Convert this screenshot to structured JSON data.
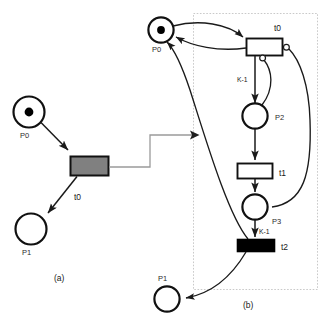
{
  "figure": {
    "type": "petri-net-diagram",
    "captions": [
      {
        "id": "caption-a",
        "text": "(a)"
      },
      {
        "id": "caption-b",
        "text": "(b)"
      }
    ],
    "colors": {
      "stroke": "#1a1a1a",
      "background": "#ffffff",
      "transition_filled_gray": "#808080",
      "transition_filled_black": "#000000",
      "transition_empty": "#ffffff",
      "dotted_group_border": "#c8c8c8",
      "connector_gray": "#8c8c8c",
      "label_text": "#2b2b2b"
    }
  },
  "panel_a": {
    "name": "(a)",
    "places": [
      {
        "id": "a-p0",
        "label": "P0",
        "tokens": 1
      },
      {
        "id": "a-p1",
        "label": "P1",
        "tokens": 0
      }
    ],
    "transitions": [
      {
        "id": "a-t0",
        "label": "t0",
        "fill": "gray"
      }
    ],
    "arcs": [
      {
        "from": "P0",
        "to": "t0",
        "kind": "normal",
        "weight": ""
      },
      {
        "from": "t0",
        "to": "P1",
        "kind": "normal",
        "weight": ""
      }
    ]
  },
  "connector": {
    "name": "refinement-arrow",
    "from": "panel_a.t0",
    "to": "panel_b",
    "style": "elbow-arrow"
  },
  "panel_b": {
    "name": "(b)",
    "group_box": {
      "style": "dotted"
    },
    "places": [
      {
        "id": "b-p0",
        "label": "P0",
        "tokens": 1
      },
      {
        "id": "b-p2",
        "label": "P2",
        "tokens": 0
      },
      {
        "id": "b-p3",
        "label": "P3",
        "tokens": 0
      },
      {
        "id": "b-p1",
        "label": "P1",
        "tokens": 0
      }
    ],
    "transitions": [
      {
        "id": "b-t0",
        "label": "t0",
        "fill": "white"
      },
      {
        "id": "b-t1",
        "label": "t1",
        "fill": "white"
      },
      {
        "id": "b-t2",
        "label": "t2",
        "fill": "black"
      }
    ],
    "arcs": [
      {
        "from": "P0",
        "to": "t0",
        "kind": "normal",
        "weight": ""
      },
      {
        "from": "t0",
        "to": "P0",
        "kind": "normal",
        "weight": ""
      },
      {
        "from": "t0",
        "to": "P2",
        "kind": "normal",
        "weight": "K-1"
      },
      {
        "from": "P2",
        "to": "t0",
        "kind": "inhibitor",
        "weight": ""
      },
      {
        "from": "P3",
        "to": "t0",
        "kind": "inhibitor",
        "weight": ""
      },
      {
        "from": "P2",
        "to": "t1",
        "kind": "normal",
        "weight": ""
      },
      {
        "from": "t1",
        "to": "P3",
        "kind": "normal",
        "weight": ""
      },
      {
        "from": "P3",
        "to": "t2",
        "kind": "normal",
        "weight": "K-1"
      },
      {
        "from": "t2",
        "to": "P0",
        "kind": "normal",
        "weight": ""
      },
      {
        "from": "t2",
        "to": "P1",
        "kind": "normal",
        "weight": ""
      }
    ],
    "arc_weights": [
      {
        "id": "b-weight-k1-top",
        "text": "K-1"
      },
      {
        "id": "b-weight-k1-bottom",
        "text": "K-1"
      }
    ]
  }
}
